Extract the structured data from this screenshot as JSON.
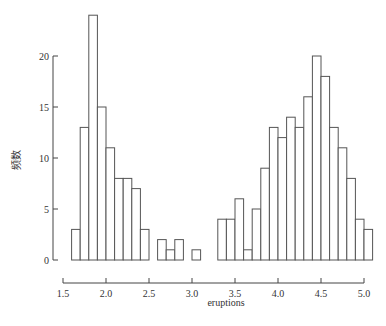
{
  "chart_data": {
    "type": "bar",
    "subtype": "histogram",
    "title": "",
    "xlabel": "eruptions",
    "ylabel": "频数",
    "bin_width": 0.1,
    "bin_starts": [
      1.6,
      1.7,
      1.8,
      1.9,
      2.0,
      2.1,
      2.2,
      2.3,
      2.4,
      2.5,
      2.6,
      2.7,
      2.8,
      2.9,
      3.0,
      3.1,
      3.2,
      3.3,
      3.4,
      3.5,
      3.6,
      3.7,
      3.8,
      3.9,
      4.0,
      4.1,
      4.2,
      4.3,
      4.4,
      4.5,
      4.6,
      4.7,
      4.8,
      4.9,
      5.0
    ],
    "values": [
      3,
      13,
      24,
      15,
      11,
      8,
      8,
      7,
      3,
      0,
      2,
      1,
      2,
      0,
      1,
      0,
      0,
      4,
      4,
      6,
      1,
      5,
      9,
      13,
      12,
      14,
      13,
      16,
      20,
      18,
      13,
      11,
      8,
      4,
      3
    ],
    "xlim": [
      1.5,
      5.0
    ],
    "ylim": [
      0,
      24
    ],
    "x_ticks": [
      1.5,
      2.0,
      2.5,
      3.0,
      3.5,
      4.0,
      4.5,
      5.0
    ],
    "x_tick_labels": [
      "1.5",
      "2.0",
      "2.5",
      "3.0",
      "3.5",
      "4.0",
      "4.5",
      "5.0"
    ],
    "y_ticks": [
      0,
      5,
      10,
      15,
      20
    ],
    "y_tick_labels": [
      "0",
      "5",
      "10",
      "15",
      "20"
    ],
    "grid": false,
    "legend": null,
    "colors": {
      "bar_fill": "#ffffff",
      "bar_stroke": "#555555",
      "axis": "#444444"
    }
  }
}
